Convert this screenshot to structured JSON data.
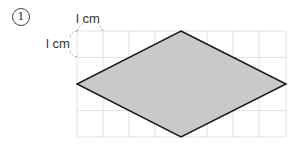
{
  "problem": {
    "number": "1"
  },
  "labels": {
    "top_unit": "l cm",
    "left_unit": "l cm"
  },
  "diagram": {
    "shape": "rhombus",
    "grid": {
      "cols": 8,
      "rows": 4,
      "cell_px": 26
    },
    "vertices": {
      "top": [
        181,
        31
      ],
      "left": [
        77,
        84
      ],
      "right": [
        286,
        84
      ],
      "bottom": [
        181,
        137
      ]
    },
    "fill": "#c9c9c9",
    "stroke": "#1a1a1a",
    "grid_color": "#e2e2e2"
  }
}
